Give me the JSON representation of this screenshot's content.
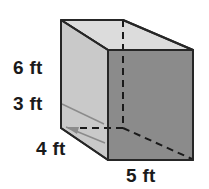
{
  "figure": {
    "name": "rectangular-prism",
    "unit": "ft"
  },
  "labels": {
    "height_upper": "6 ft",
    "height_lower": "3 ft",
    "depth": "4 ft",
    "width": "5 ft"
  },
  "dimensions": {
    "height_upper_value": 6,
    "height_lower_value": 3,
    "depth_value": 4,
    "width_value": 5,
    "unit": "ft"
  },
  "colors": {
    "front_face": "#8b8b8b",
    "left_face": "#c9c9c9",
    "top_face": "#dcdcdc",
    "outline": "#262626",
    "hidden_edge": "#1a1a1a",
    "leader_line": "#8b8b8b",
    "background": "#ffffff",
    "text": "#1a1a1a"
  }
}
